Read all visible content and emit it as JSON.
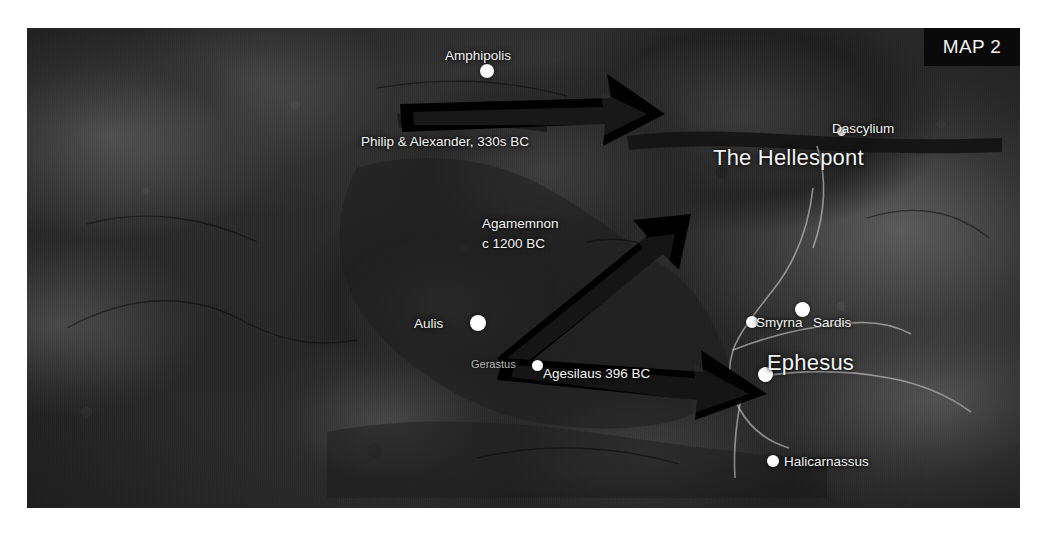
{
  "map": {
    "corner_plate_label": "MAP 2",
    "colors": {
      "label_text": "#f4f4f4",
      "dim_label_text": "#b9b9b9",
      "city_dot": "#ffffff",
      "arrow_fill": "#000000",
      "plate_background": "#0a0a0a",
      "page_background": "#ffffff",
      "coastline": "#cfcfcf"
    },
    "cities": [
      {
        "name": "Amphipolis",
        "label_x": 485,
        "label_y": 54,
        "dot_x": 487,
        "dot_y": 71,
        "dot_r": 7,
        "style": "city",
        "anchor": "middle"
      },
      {
        "name": "Dascylium",
        "label_x": 861,
        "label_y": 126,
        "dot_x": 842,
        "dot_y": 132,
        "dot_r": 4.5,
        "style": "city",
        "anchor": "middle"
      },
      {
        "name": "Smyrna",
        "label_x": 787,
        "label_y": 325,
        "dot_x": 752,
        "dot_y": 322,
        "dot_r": 6,
        "style": "city",
        "anchor": "middle"
      },
      {
        "name": "Sardis",
        "label_x": 840,
        "label_y": 325,
        "dot_x": 803,
        "dot_y": 310,
        "dot_r": 7.5,
        "style": "city",
        "anchor": "middle"
      },
      {
        "name": "Ephesus",
        "label_x": 808,
        "label_y": 367,
        "dot_x": 766,
        "dot_y": 375,
        "dot_r": 7.5,
        "style": "big",
        "anchor": "middle"
      },
      {
        "name": "Halicarnassus",
        "label_x": 828,
        "label_y": 466,
        "dot_x": 773,
        "dot_y": 461,
        "dot_r": 6,
        "style": "city",
        "anchor": "middle"
      },
      {
        "name": "Aulis",
        "label_x": 450,
        "label_y": 330,
        "dot_x": 478,
        "dot_y": 323,
        "dot_r": 8,
        "style": "city",
        "anchor": "middle"
      },
      {
        "name": "Gerastus",
        "label_x": 494,
        "label_y": 369,
        "dot_x": 538,
        "dot_y": 366,
        "dot_r": 5.5,
        "style": "dim",
        "anchor": "middle"
      }
    ],
    "water_labels": [
      {
        "name": "The Hellespont",
        "x": 781,
        "y": 160
      }
    ],
    "route_labels": [
      {
        "name": "Philip & Alexander, 330s BC",
        "x": 462,
        "y": 142,
        "lines": [
          "Philip & Alexander, 330s BC"
        ]
      },
      {
        "name": "Agamemnon c 1200 BC",
        "x": 522,
        "y": 228,
        "lines": [
          "Agamemnon",
          "c 1200 BC"
        ]
      },
      {
        "name": "Agesilaus 396 BC",
        "x": 597,
        "y": 377,
        "lines": [
          "Agesilaus 396 BC"
        ]
      }
    ],
    "campaign_arrows": [
      {
        "name": "philip-alexander-arrow",
        "from": "Amphipolis region",
        "to": "The Hellespont",
        "direction": "east"
      },
      {
        "name": "agamemnon-arrow",
        "from": "Aulis",
        "to": "The Hellespont",
        "direction": "northeast"
      },
      {
        "name": "agesilaus-arrow",
        "from": "Aulis",
        "to": "Ephesus",
        "direction": "southeast"
      }
    ]
  }
}
